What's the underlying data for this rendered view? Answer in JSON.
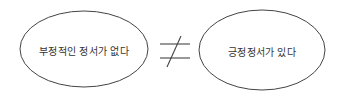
{
  "diagram": {
    "left_node": {
      "label": "부정적인 정서가 없다"
    },
    "relation": {
      "symbol": "≠",
      "meaning": "not-equal"
    },
    "right_node": {
      "label": "긍정정서가 있다"
    }
  },
  "colors": {
    "stroke": "#444444",
    "text": "#333333",
    "background": "#ffffff"
  }
}
